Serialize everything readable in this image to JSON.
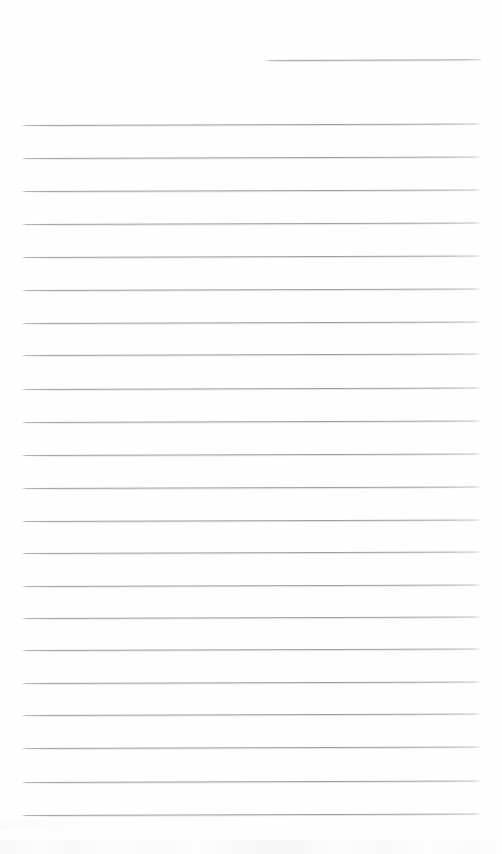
{
  "document": {
    "kind": "blank-lined-paper-scan",
    "title": "Blank Lined Notebook Page",
    "width": 502,
    "height": 854,
    "background_color": "#ffffff",
    "paper_color": "#fefefe",
    "text_content": "",
    "visible_text": []
  },
  "rules": {
    "line_color": "#969698",
    "line_thickness_px": 1,
    "left_margin_px": 21,
    "right_margin_px": 482,
    "line_spacing_px": 32.8,
    "tilt_deg": -0.18,
    "partial_line": {
      "label": "header-rule",
      "y": 60,
      "x_start": 264,
      "x_end": 482
    },
    "full_lines": [
      {
        "y": 125
      },
      {
        "y": 158
      },
      {
        "y": 191
      },
      {
        "y": 224
      },
      {
        "y": 257
      },
      {
        "y": 290
      },
      {
        "y": 323
      },
      {
        "y": 355
      },
      {
        "y": 389
      },
      {
        "y": 422
      },
      {
        "y": 455
      },
      {
        "y": 488
      },
      {
        "y": 521
      },
      {
        "y": 553
      },
      {
        "y": 586
      },
      {
        "y": 618
      },
      {
        "y": 650
      },
      {
        "y": 683
      },
      {
        "y": 715
      },
      {
        "y": 748
      },
      {
        "y": 782
      },
      {
        "y": 815
      }
    ],
    "total_full_lines": 22
  },
  "artifacts": {
    "bottom_edge_band": {
      "present": true,
      "y": 840,
      "height": 14,
      "color": "#f7f7f8"
    },
    "bottom_left_smudge": {
      "present": true,
      "y": 820,
      "width": 180,
      "color": "#f9f9fa"
    }
  }
}
